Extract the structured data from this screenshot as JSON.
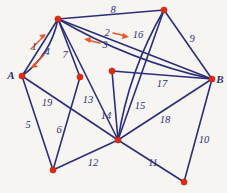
{
  "figure": {
    "background_color": "#f7f5f1",
    "edge_color": "#2b2f7a",
    "vertex_color": "#e02b12",
    "label_color": "#2b2f7a",
    "arrow_color": "#e8592a"
  },
  "chart_data": {
    "type": "diagram",
    "title": "",
    "subtitle": "",
    "xlabel": "",
    "ylabel": "",
    "grid": false,
    "legend": "none",
    "vertices": [
      {
        "id": "v_top_left",
        "label": "",
        "x": 58,
        "y": 19
      },
      {
        "id": "v_top_right",
        "label": "",
        "x": 164,
        "y": 10
      },
      {
        "id": "v_A",
        "label": "A",
        "x": 22,
        "y": 76,
        "label_x": 11,
        "label_y": 75
      },
      {
        "id": "v_B",
        "label": "B",
        "x": 212,
        "y": 79,
        "label_x": 220,
        "label_y": 79
      },
      {
        "id": "v_mid_left",
        "label": "",
        "x": 80,
        "y": 77
      },
      {
        "id": "v_mid_center",
        "label": "",
        "x": 112,
        "y": 71
      },
      {
        "id": "v_bottom_left",
        "label": "",
        "x": 53,
        "y": 170
      },
      {
        "id": "v_bottom_hub",
        "label": "",
        "x": 118,
        "y": 140
      },
      {
        "id": "v_bottom_right",
        "label": "",
        "x": 184,
        "y": 182
      }
    ],
    "edges": [
      {
        "label": "1",
        "from": "v_A",
        "to": "v_top_left",
        "label_x": 34,
        "label_y": 47
      },
      {
        "label": "2",
        "from": "v_top_left",
        "to": "v_B",
        "label_x": 107,
        "label_y": 33
      },
      {
        "label": "3",
        "from": "v_top_left",
        "to": "v_B",
        "label_x": 105,
        "label_y": 45
      },
      {
        "label": "4",
        "from": "v_A",
        "to": "v_top_left",
        "label_x": 47,
        "label_y": 52
      },
      {
        "label": "5",
        "from": "v_A",
        "to": "v_bottom_left",
        "label_x": 28,
        "label_y": 125
      },
      {
        "label": "6",
        "from": "v_mid_left",
        "to": "v_bottom_left",
        "label_x": 59,
        "label_y": 130
      },
      {
        "label": "7",
        "from": "v_top_left",
        "to": "v_mid_left",
        "label_x": 65,
        "label_y": 55
      },
      {
        "label": "8",
        "from": "v_top_left",
        "to": "v_top_right",
        "label_x": 113,
        "label_y": 10
      },
      {
        "label": "9",
        "from": "v_top_right",
        "to": "v_B",
        "label_x": 192,
        "label_y": 39
      },
      {
        "label": "10",
        "from": "v_B",
        "to": "v_bottom_right",
        "label_x": 204,
        "label_y": 140
      },
      {
        "label": "11",
        "from": "v_bottom_hub",
        "to": "v_bottom_right",
        "label_x": 153,
        "label_y": 163
      },
      {
        "label": "12",
        "from": "v_bottom_left",
        "to": "v_bottom_hub",
        "label_x": 93,
        "label_y": 163
      },
      {
        "label": "13",
        "from": "v_top_left",
        "to": "v_bottom_hub",
        "label_x": 88,
        "label_y": 100
      },
      {
        "label": "14",
        "from": "v_mid_center",
        "to": "v_bottom_hub",
        "label_x": 106,
        "label_y": 116
      },
      {
        "label": "15",
        "from": "v_top_right",
        "to": "v_bottom_hub",
        "label_x": 140,
        "label_y": 106
      },
      {
        "label": "16",
        "from": "v_top_right",
        "to": "v_bottom_hub",
        "label_x": 138,
        "label_y": 35
      },
      {
        "label": "17",
        "from": "v_mid_center",
        "to": "v_B",
        "label_x": 162,
        "label_y": 84
      },
      {
        "label": "18",
        "from": "v_B",
        "to": "v_bottom_hub",
        "label_x": 165,
        "label_y": 120
      },
      {
        "label": "19",
        "from": "v_A",
        "to": "v_bottom_hub",
        "label_x": 47,
        "label_y": 103
      }
    ],
    "annotations": [
      {
        "id": "arrow-up-right",
        "direction": "up-right",
        "near_label": "1"
      },
      {
        "id": "arrow-down-left",
        "direction": "down-left",
        "near_label": "1"
      },
      {
        "id": "arrow-right",
        "direction": "right",
        "near_label": "2"
      },
      {
        "id": "arrow-left",
        "direction": "left",
        "near_label": "3"
      }
    ]
  }
}
